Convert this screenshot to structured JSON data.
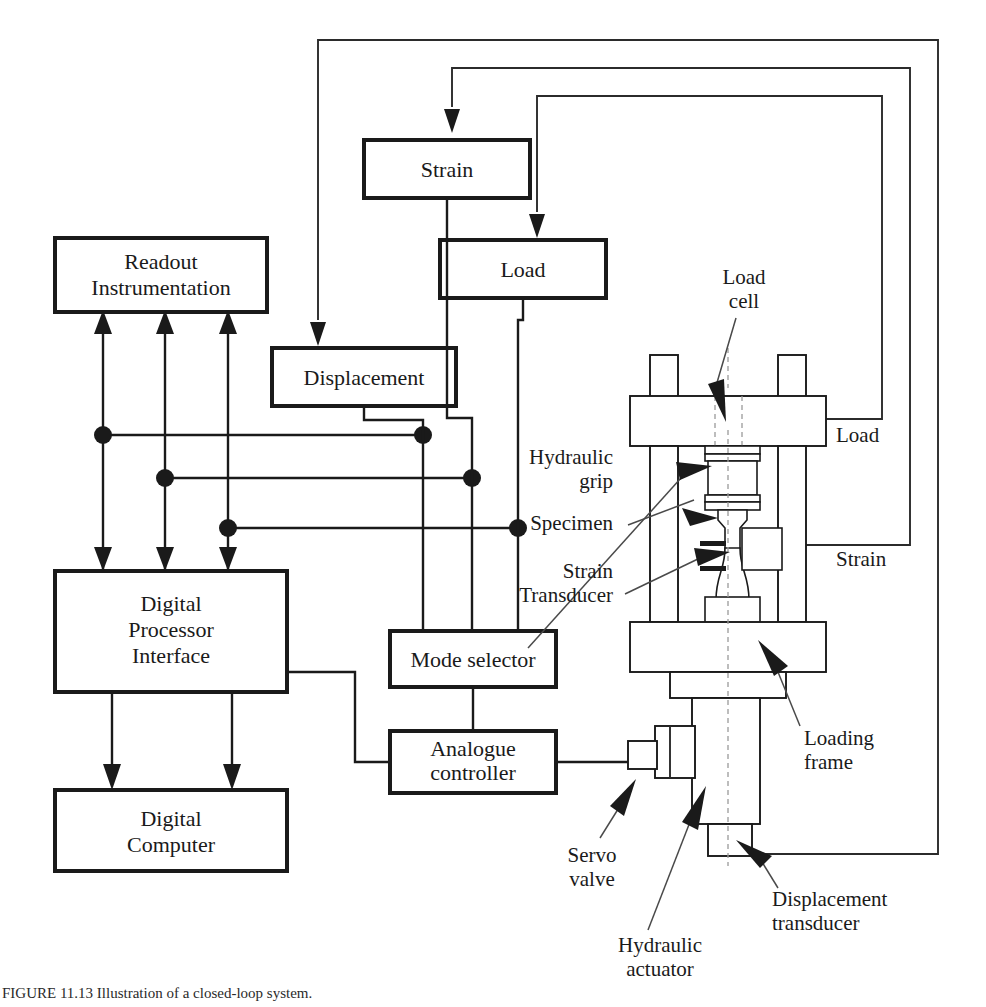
{
  "figure": {
    "caption": "FIGURE 11.13   Illustration of a closed-loop system."
  },
  "blocks": [
    {
      "id": "readout",
      "label": "Readout\nInstrumentation",
      "lines": [
        "Readout",
        "Instrumentation"
      ]
    },
    {
      "id": "dpi",
      "label": "Digital Processor Interface",
      "lines": [
        "Digital",
        "Processor",
        "Interface"
      ]
    },
    {
      "id": "computer",
      "label": "Digital Computer",
      "lines": [
        "Digital",
        "Computer"
      ]
    },
    {
      "id": "strain",
      "label": "Strain",
      "lines": [
        "Strain"
      ]
    },
    {
      "id": "load",
      "label": "Load",
      "lines": [
        "Load"
      ]
    },
    {
      "id": "displacement",
      "label": "Displacement",
      "lines": [
        "Displacement"
      ]
    },
    {
      "id": "mode",
      "label": "Mode selector",
      "lines": [
        "Mode selector"
      ]
    },
    {
      "id": "analogue",
      "label": "Analogue controller",
      "lines": [
        "Analogue",
        "controller"
      ]
    }
  ],
  "machine_labels": [
    {
      "id": "load-cell",
      "lines": [
        "Load",
        "cell"
      ],
      "align": "middle"
    },
    {
      "id": "hydraulic-grip",
      "lines": [
        "Hydraulic",
        "grip"
      ],
      "align": "end"
    },
    {
      "id": "specimen",
      "lines": [
        "Specimen"
      ],
      "align": "end"
    },
    {
      "id": "strain-transducer",
      "lines": [
        "Strain",
        "Transducer"
      ],
      "align": "end"
    },
    {
      "id": "loading-frame",
      "lines": [
        "Loading",
        "frame"
      ],
      "align": "start"
    },
    {
      "id": "servo-valve",
      "lines": [
        "Servo",
        "valve"
      ],
      "align": "middle"
    },
    {
      "id": "hydraulic-actuator",
      "lines": [
        "Hydraulic",
        "actuator"
      ],
      "align": "middle"
    },
    {
      "id": "displacement-transducer",
      "lines": [
        "Displacement",
        "transducer"
      ],
      "align": "start"
    }
  ],
  "feedback_labels": [
    {
      "id": "load-feedback",
      "text": "Load"
    },
    {
      "id": "strain-feedback",
      "text": "Strain"
    }
  ],
  "text": {
    "readout_l1": "Readout",
    "readout_l2": "Instrumentation",
    "dpi_l1": "Digital",
    "dpi_l2": "Processor",
    "dpi_l3": "Interface",
    "computer_l1": "Digital",
    "computer_l2": "Computer",
    "strain": "Strain",
    "load": "Load",
    "displacement": "Displacement",
    "mode_selector": "Mode selector",
    "analogue_l1": "Analogue",
    "analogue_l2": "controller",
    "loadcell_l1": "Load",
    "loadcell_l2": "cell",
    "hydgrip_l1": "Hydraulic",
    "hydgrip_l2": "grip",
    "specimen": "Specimen",
    "straintr_l1": "Strain",
    "straintr_l2": "Transducer",
    "loadingframe_l1": "Loading",
    "loadingframe_l2": "frame",
    "servovalve_l1": "Servo",
    "servovalve_l2": "valve",
    "hydact_l1": "Hydraulic",
    "hydact_l2": "actuator",
    "disptr_l1": "Displacement",
    "disptr_l2": "transducer",
    "fb_load": "Load",
    "fb_strain": "Strain",
    "caption": "FIGURE 11.13   Illustration of a closed-loop system."
  },
  "colors": {
    "ink": "#1a1a1a",
    "wire": "#2b2b2b",
    "leader": "#4a4a4a",
    "background": "#ffffff"
  }
}
